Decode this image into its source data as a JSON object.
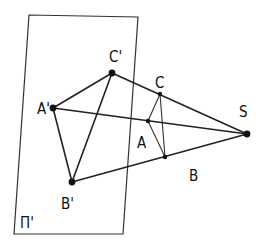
{
  "diagram": {
    "plane": {
      "label": "Π'",
      "corners": [
        [
          29,
          15
        ],
        [
          138,
          17
        ],
        [
          123,
          234
        ],
        [
          14,
          234
        ]
      ]
    },
    "points": {
      "S": {
        "label": "S",
        "x": 247,
        "y": 134,
        "label_x": 239,
        "label_y": 117
      },
      "A": {
        "label": "A",
        "x": 148,
        "y": 121,
        "label_x": 137,
        "label_y": 148
      },
      "B": {
        "label": "B",
        "x": 165,
        "y": 157,
        "label_x": 189,
        "label_y": 181
      },
      "C": {
        "label": "C",
        "x": 160,
        "y": 94,
        "label_x": 155,
        "label_y": 88
      },
      "A'": {
        "label": "A'",
        "x": 53,
        "y": 108,
        "label_x": 37,
        "label_y": 114
      },
      "B'": {
        "label": "B'",
        "x": 72,
        "y": 182,
        "label_x": 61,
        "label_y": 209
      },
      "C'": {
        "label": "C'",
        "x": 112,
        "y": 73,
        "label_x": 109,
        "label_y": 62
      }
    },
    "segments": [
      [
        "A'",
        "C'"
      ],
      [
        "A'",
        "B'"
      ],
      [
        "B'",
        "C'"
      ],
      [
        "A",
        "C"
      ],
      [
        "A",
        "B"
      ],
      [
        "B",
        "C"
      ],
      [
        "S",
        "A'"
      ],
      [
        "S",
        "B'"
      ],
      [
        "S",
        "C'"
      ]
    ],
    "plane_label_pos": {
      "x": 20,
      "y": 228
    }
  }
}
